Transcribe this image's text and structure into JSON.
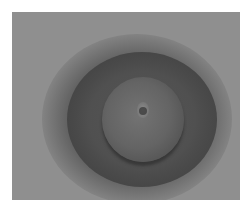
{
  "image": {
    "description": "Blurry grayscale close-up photograph of a circular, concentric structure with a dark outer ring and a lighter central disc",
    "colors": {
      "border": "#ffffff",
      "background_gray": "#8f8f8f",
      "dark_ring": "#505050",
      "inner_disc": "#6e6e6e",
      "center_highlight": "#8c8c8c"
    }
  }
}
